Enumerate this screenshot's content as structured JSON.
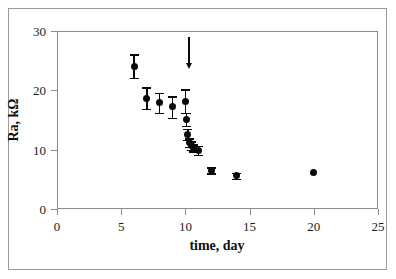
{
  "figure": {
    "background_color": "#ffffff",
    "frame_color": "#9a9a9a",
    "axis_color": "#8c8c8c",
    "marker_color": "#0a0a0a"
  },
  "chart_data": {
    "type": "scatter",
    "title": "",
    "subtitle": "",
    "xlabel": "time, day",
    "ylabel": "Ra, kΩ",
    "xlim": [
      0,
      25
    ],
    "ylim": [
      0,
      30
    ],
    "xticks": [
      0,
      5,
      10,
      15,
      20,
      25
    ],
    "yticks": [
      0,
      10,
      20,
      30
    ],
    "xtick_labels": [
      "0",
      "5",
      "10",
      "15",
      "20",
      "25"
    ],
    "ytick_labels": [
      "0",
      "10",
      "20",
      "30"
    ],
    "grid": false,
    "legend": null,
    "series": [
      {
        "name": "Ra",
        "marker": "filled-circle",
        "color": "#0a0a0a",
        "error_bars": "y",
        "points": [
          {
            "x": 6.0,
            "y": 24.1,
            "yerr": 2.0
          },
          {
            "x": 7.0,
            "y": 18.7,
            "yerr": 1.8
          },
          {
            "x": 8.0,
            "y": 17.9,
            "yerr": 1.7
          },
          {
            "x": 9.0,
            "y": 17.2,
            "yerr": 1.8
          },
          {
            "x": 10.0,
            "y": 18.2,
            "yerr": 2.0
          },
          {
            "x": 10.1,
            "y": 15.1,
            "yerr": 1.1
          },
          {
            "x": 10.2,
            "y": 12.6,
            "yerr": 0.9
          },
          {
            "x": 10.3,
            "y": 11.2,
            "yerr": 0.7
          },
          {
            "x": 10.5,
            "y": 10.7,
            "yerr": 0.7
          },
          {
            "x": 10.6,
            "y": 10.3,
            "yerr": 0.6
          },
          {
            "x": 11.0,
            "y": 9.9,
            "yerr": 0.8
          },
          {
            "x": 12.0,
            "y": 6.5,
            "yerr": 0.5
          },
          {
            "x": 14.0,
            "y": 5.6,
            "yerr": 0.5
          },
          {
            "x": 20.0,
            "y": 6.2,
            "yerr": 0.0
          }
        ]
      }
    ],
    "annotations": [
      {
        "kind": "arrow",
        "direction": "down",
        "x": 10.3,
        "y_start": 29.0,
        "y_end": 23.8,
        "label": ""
      }
    ]
  }
}
